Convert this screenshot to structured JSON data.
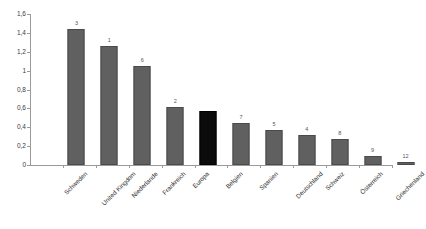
{
  "chart_data": {
    "type": "bar",
    "title": "",
    "subtitle": "",
    "xlabel": "",
    "ylabel": "",
    "ylim": [
      0,
      1.6
    ],
    "ytick_labels": [
      "0",
      "0,2",
      "0,4",
      "0,6",
      "0,8",
      "1",
      "1,2",
      "1,4",
      "1,6"
    ],
    "ytick_values": [
      0,
      0.2,
      0.4,
      0.6,
      0.8,
      1.0,
      1.2,
      1.4,
      1.6
    ],
    "grid": false,
    "legend": "none",
    "decimal_separator": ",",
    "highlight_category": "Europa",
    "colors": {
      "bar": "#606060",
      "bar_border": "#4a4a4a",
      "highlight_bar": "#0b0b0b",
      "axis": "#9a9a9a",
      "text": "#2e2e2e",
      "background": "#ffffff"
    },
    "categories": [
      "Schweden",
      "United Kingdom",
      "Niederlande",
      "Frankreich",
      "Europa",
      "Belgien",
      "Spanien",
      "Deutschland",
      "Schweiz",
      "Österreich",
      "Griechenland"
    ],
    "values": [
      1.44,
      1.26,
      1.05,
      0.61,
      0.57,
      0.45,
      0.37,
      0.32,
      0.28,
      0.1,
      0.03
    ],
    "point_labels": [
      "3",
      "1",
      "6",
      "2",
      "",
      "7",
      "5",
      "4",
      "8",
      "9",
      "12"
    ],
    "series": [
      {
        "name": "",
        "values": [
          1.44,
          1.26,
          1.05,
          0.61,
          0.57,
          0.45,
          0.37,
          0.32,
          0.28,
          0.1,
          0.03
        ]
      }
    ]
  }
}
